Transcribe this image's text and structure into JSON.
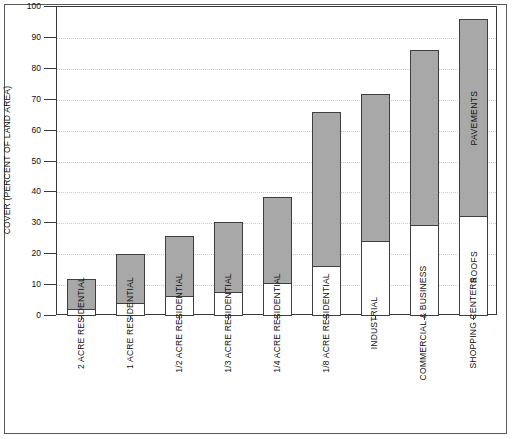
{
  "chart_data": {
    "type": "bar",
    "subtype": "stacked",
    "title": "",
    "xlabel": "",
    "ylabel": "COVER (PERCENT OF LAND AREA)",
    "ylim": [
      0,
      100
    ],
    "yticks": [
      0,
      10,
      20,
      30,
      40,
      50,
      60,
      70,
      80,
      90,
      100
    ],
    "grid": true,
    "legend_position": "in-plot-annotations",
    "categories": [
      "2 ACRE RESIDENTIAL",
      "1 ACRE RESIDENTIAL",
      "1/2 ACRE RESIDENTIAL",
      "1/3 ACRE RESIDENTIAL",
      "1/4 ACRE RESIDENTIAL",
      "1/8 ACRE RESIDENTIAL",
      "INDUSTRIAL",
      "COMMERCIAL & BUSINESS",
      "SHOPPING CENTERS"
    ],
    "series": [
      {
        "name": "ROOFS",
        "color": "#ffffff",
        "values": [
          2,
          4,
          6,
          7.5,
          10.5,
          16,
          24,
          29,
          32
        ]
      },
      {
        "name": "PAVEMENTS",
        "color": "#a8a8a8",
        "values": [
          10,
          16,
          20,
          23,
          28,
          50,
          48,
          57,
          64
        ]
      }
    ],
    "totals": [
      12,
      20,
      26,
      30.5,
      38.5,
      66,
      72,
      86,
      96
    ],
    "annotations": [
      {
        "text": "PAVEMENTS",
        "category": "SHOPPING CENTERS",
        "segment": "PAVEMENTS"
      },
      {
        "text": "ROOFS",
        "category": "SHOPPING CENTERS",
        "segment": "ROOFS"
      }
    ]
  },
  "colors": {
    "bar_fill_gray": "#a8a8a8",
    "bar_fill_white": "#ffffff",
    "bar_border": "#3f3f3f",
    "axis": "#3a3a3a",
    "gridline": "#c9c9c9",
    "frame": "#5a5a5a",
    "background": "#ffffff"
  }
}
